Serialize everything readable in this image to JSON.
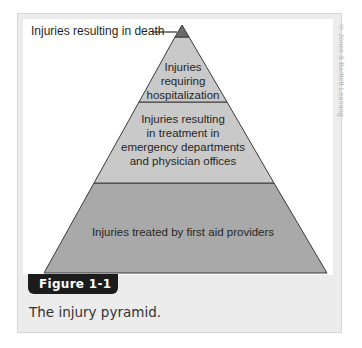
{
  "figure": {
    "tab_label": "Figure 1-1",
    "caption": "The injury pyramid.",
    "credit": "© Jones & Bartlett Learning"
  },
  "pyramid": {
    "callout_label": "Injuries resulting in death",
    "layers": [
      {
        "id": "death",
        "label": "",
        "color": "#6a6a6a"
      },
      {
        "id": "hospitalization",
        "label_lines": [
          "Injuries",
          "requiring",
          "hospitalization"
        ],
        "color": "#c9c9c9"
      },
      {
        "id": "treatment",
        "label_lines": [
          "Injuries resulting",
          "in treatment in",
          "emergency departments",
          "and physician offices"
        ],
        "color": "#c9c9c9"
      },
      {
        "id": "first-aid",
        "label": "Injuries treated by first aid providers",
        "color": "#a9a9a9"
      }
    ]
  },
  "colors": {
    "frame_bg": "#ececec",
    "panel_bg": "#ffffff",
    "tab_bg": "#1c1c1c",
    "outline": "#3a3a3a"
  }
}
